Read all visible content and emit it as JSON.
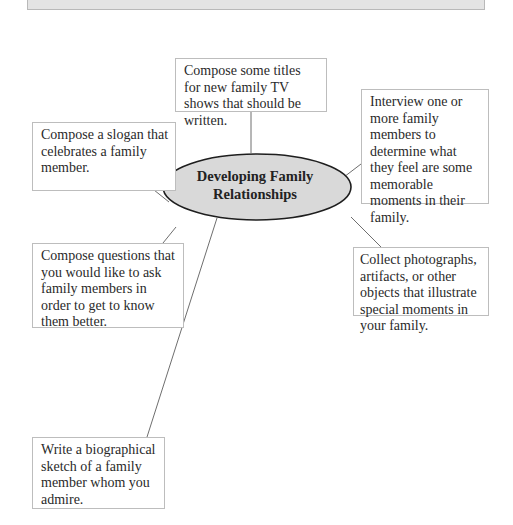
{
  "diagram": {
    "type": "idea-web",
    "center": {
      "label_line1": "Developing Family",
      "label_line2": "Relationships"
    },
    "nodes": [
      {
        "id": "tv-titles",
        "text": "Compose some titles for new family TV shows that should be written."
      },
      {
        "id": "interview",
        "text": "Interview one or more family members to determine what they feel are some memorable moments in their family."
      },
      {
        "id": "slogan",
        "text": "Compose a slogan that celebrates a family member."
      },
      {
        "id": "questions",
        "text": "Compose questions that you would like to ask family members in order to get to know them better."
      },
      {
        "id": "collect",
        "text": "Collect photographs, artifacts, or other objects that illustrate special moments in your family."
      },
      {
        "id": "biography",
        "text": "Write a biographical sketch of a family member whom you admire."
      }
    ],
    "colors": {
      "hub_fill": "#d9d9d9",
      "hub_stroke": "#1e1e1e",
      "line": "#6e6e6e",
      "box_border": "#bdbdbd",
      "top_bar": "#e4e4e4"
    }
  }
}
